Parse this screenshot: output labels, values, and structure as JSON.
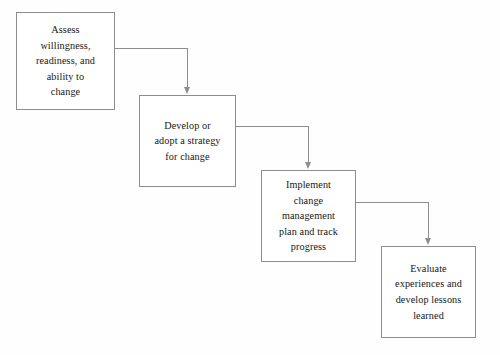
{
  "diagram": {
    "type": "flowchart",
    "orientation": "cascading-left-to-right-descending",
    "background_color": "#fefefe",
    "box_border_color": "#8d8d8d",
    "connector_color": "#8d8d8d",
    "text_color": "#161616",
    "nodes": [
      {
        "id": "node-1",
        "label": "Assess\nwillingness,\nreadiness, and\nability to\nchange",
        "x": 16,
        "y": 12,
        "width": 99,
        "height": 98
      },
      {
        "id": "node-2",
        "label": "Develop or\nadopt a strategy\nfor change",
        "x": 139,
        "y": 95,
        "width": 97,
        "height": 92
      },
      {
        "id": "node-3",
        "label": "Implement\nchange\nmanagement\nplan and track\nprogress",
        "x": 261,
        "y": 170,
        "width": 95,
        "height": 92
      },
      {
        "id": "node-4",
        "label": "Evaluate\nexperiences and\ndevelop lessons\nlearned",
        "x": 381,
        "y": 246,
        "width": 95,
        "height": 92
      }
    ],
    "connectors": [
      {
        "id": "connector-1",
        "from": "node-1",
        "to": "node-2",
        "start_x": 115,
        "start_y": 48,
        "corner_x": 187,
        "end_y": 94
      },
      {
        "id": "connector-2",
        "from": "node-2",
        "to": "node-3",
        "start_x": 236,
        "start_y": 126,
        "corner_x": 308,
        "end_y": 169
      },
      {
        "id": "connector-3",
        "from": "node-3",
        "to": "node-4",
        "start_x": 356,
        "start_y": 202,
        "corner_x": 428,
        "end_y": 245
      }
    ],
    "caption_partial": ""
  }
}
